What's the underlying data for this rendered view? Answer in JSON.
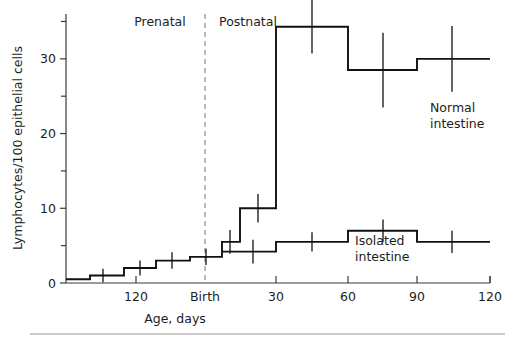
{
  "chart_data": {
    "type": "line",
    "subtype": "step",
    "title": "",
    "xlabel": "Age, days",
    "ylabel": "Lymphocytes/100 epithelial cells",
    "ylim": [
      0,
      36
    ],
    "y_major_ticks": [
      0,
      10,
      20,
      30
    ],
    "y_minor_ticks": [
      5,
      15,
      25,
      35
    ],
    "x_axis": {
      "description": "Age in days, prenatal counting down to Birth then postnatal counting up",
      "tick_labels": [
        "120",
        "Birth",
        "30",
        "60",
        "90",
        "120"
      ],
      "tick_positions_px": [
        136,
        205,
        276,
        348,
        417,
        490
      ],
      "prenatal_label": "Prenatal",
      "postnatal_label": "Postnatal",
      "birth_label": "Birth"
    },
    "grid": false,
    "legend_position": "inline-annotations",
    "series": [
      {
        "name": "Normal intestine",
        "label": "Normal intestine",
        "label_line1": "Normal",
        "label_line2": "intestine",
        "steps": [
          {
            "x0": 66,
            "x1": 90,
            "value": 0.5
          },
          {
            "x0": 90,
            "x1": 124,
            "value": 1.0
          },
          {
            "x0": 124,
            "x1": 156,
            "value": 2.0
          },
          {
            "x0": 156,
            "x1": 190,
            "value": 3.0
          },
          {
            "x0": 190,
            "x1": 222,
            "value": 3.5
          },
          {
            "x0": 222,
            "x1": 240,
            "value": 5.5
          },
          {
            "x0": 240,
            "x1": 276,
            "value": 10.0
          },
          {
            "x0": 276,
            "x1": 348,
            "value": 34.3
          },
          {
            "x0": 348,
            "x1": 417,
            "value": 28.5
          },
          {
            "x0": 417,
            "x1": 490,
            "value": 30.0
          }
        ],
        "error_bars": [
          {
            "x": 103,
            "value": 1.0,
            "err": 0.9
          },
          {
            "x": 140,
            "value": 2.0,
            "err": 1.0
          },
          {
            "x": 172,
            "value": 3.0,
            "err": 1.1
          },
          {
            "x": 206,
            "value": 3.5,
            "err": 1.1
          },
          {
            "x": 230,
            "value": 5.5,
            "err": 1.6
          },
          {
            "x": 258,
            "value": 10.0,
            "err": 1.9
          },
          {
            "x": 312,
            "value": 34.3,
            "err": 3.6
          },
          {
            "x": 383,
            "value": 28.5,
            "err": 5.0
          },
          {
            "x": 452,
            "value": 30.0,
            "err": 4.4
          }
        ]
      },
      {
        "name": "Isolated intestine",
        "label": "Isolated intestine",
        "label_line1": "Isolated",
        "label_line2": "intestine",
        "steps": [
          {
            "x0": 222,
            "x1": 276,
            "value": 4.2
          },
          {
            "x0": 276,
            "x1": 348,
            "value": 5.5
          },
          {
            "x0": 348,
            "x1": 417,
            "value": 7.0
          },
          {
            "x0": 417,
            "x1": 490,
            "value": 5.5
          }
        ],
        "error_bars": [
          {
            "x": 253,
            "value": 4.2,
            "err": 1.6
          },
          {
            "x": 312,
            "value": 5.5,
            "err": 1.3
          },
          {
            "x": 383,
            "value": 7.0,
            "err": 1.5
          },
          {
            "x": 452,
            "value": 5.5,
            "err": 1.5
          }
        ]
      }
    ],
    "annotations": [
      {
        "name": "prenatal-label",
        "text": "Prenatal",
        "x": 160,
        "y": 26
      },
      {
        "name": "postnatal-label",
        "text": "Postnatal",
        "x": 248,
        "y": 26
      }
    ],
    "divider": {
      "name": "birth-divider",
      "x": 205,
      "y0": 14,
      "y1": 283
    }
  },
  "colors": {
    "curve": "#111111",
    "axis": "#3b3b3b",
    "divider": "#8a8a8a",
    "background": "#ffffff",
    "rule": "#9a9a9a"
  }
}
